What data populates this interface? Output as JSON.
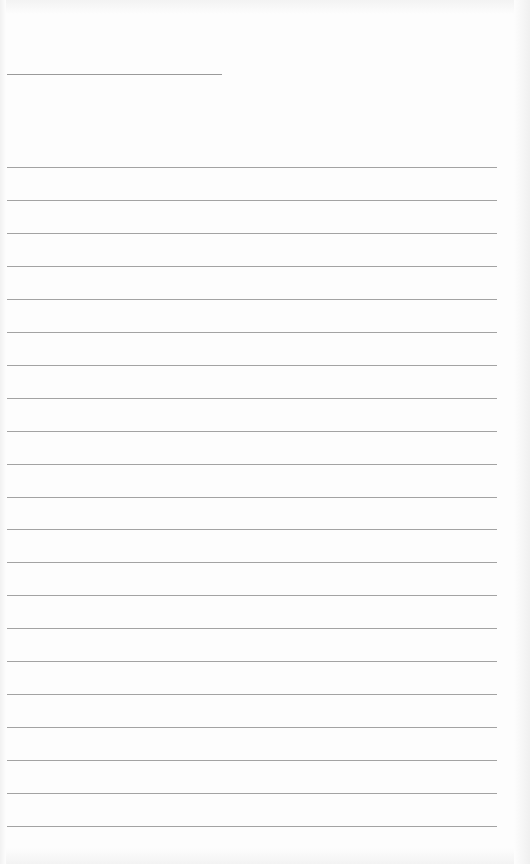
{
  "document": {
    "type": "lined-paper",
    "header_rule": {
      "x": 7,
      "y": 74,
      "width": 215
    },
    "rules": {
      "count": 21,
      "start_y": 167,
      "spacing": 32.95,
      "x": 7,
      "width": 490
    },
    "line_color": "#a3a3a3",
    "paper_color": "#fdfdfd",
    "text": []
  }
}
